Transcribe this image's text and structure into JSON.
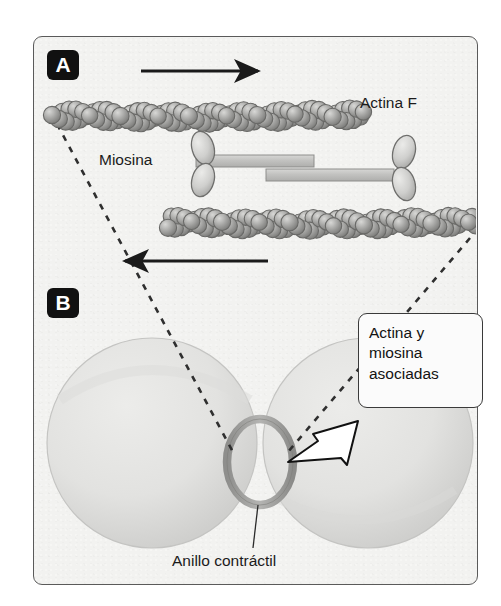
{
  "figure": {
    "kind": "biology-diagram",
    "background_color": "#ffffff",
    "panel_color": "#f2f2f0",
    "panel_border_color": "#5a5a5a"
  },
  "panels": [
    {
      "id": "A",
      "badge": "A",
      "caption": "Sliding actin filaments with bipolar myosin"
    },
    {
      "id": "B",
      "badge": "B",
      "caption": "Dividing cell with contractile ring"
    }
  ],
  "labels": {
    "actina_f": "Actina F",
    "miosina": "Miosina",
    "anillo_contractil": "Anillo contráctil"
  },
  "callout": {
    "lines": [
      "Actina y",
      "miosina",
      "asociadas"
    ],
    "border_color": "#3a3a3a",
    "fill_color": "#fbfbfb",
    "arrow_fill": "#ffffff",
    "arrow_outline": "#111111"
  },
  "panel_a": {
    "arrows": [
      {
        "name": "top-arrow",
        "direction": "right"
      },
      {
        "name": "bottom-arrow",
        "direction": "left"
      }
    ],
    "filaments": [
      {
        "name": "actin-filament-top",
        "subunits": 46,
        "color": "#9a9a98"
      },
      {
        "name": "actin-filament-bottom",
        "subunits": 46,
        "color": "#9a9a98"
      }
    ],
    "myosin": {
      "rods": 2,
      "heads": 4,
      "rod_color": "#c9c9c7",
      "head_color": "#dcdcda"
    }
  },
  "panel_b": {
    "cell_lobes": 2,
    "lobe_color": "#e4e4e2",
    "ring": {
      "name": "contractile-ring",
      "shape": "ellipse",
      "color": "#9b9b99"
    },
    "connector_lines": 2,
    "connector_style": "dashed"
  }
}
